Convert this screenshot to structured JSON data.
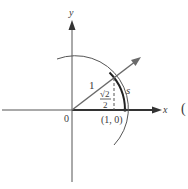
{
  "figure": {
    "axes": {
      "x_label": "x",
      "y_label": "y",
      "origin_label": "0"
    },
    "labels": {
      "radius": "1",
      "sqrt2_num": "√2",
      "sqrt2_den": "2",
      "arc": "s",
      "point": "(1, 0)",
      "right_paren": "("
    },
    "colors": {
      "line": "#3a3a3a",
      "ray": "#6a6a6a",
      "background": "#ffffff"
    }
  }
}
